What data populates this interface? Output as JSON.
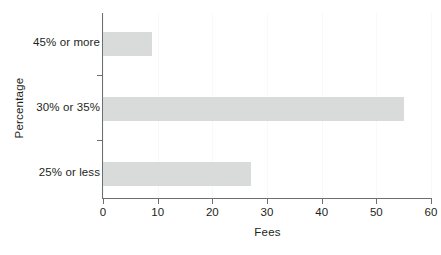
{
  "chart_data": {
    "type": "bar",
    "orientation": "horizontal",
    "title": "",
    "xlabel": "Fees",
    "ylabel": "Percentage",
    "categories": [
      "25% or less",
      "30% or 35%",
      "45% or more"
    ],
    "values": [
      27,
      55,
      9
    ],
    "xlim": [
      0,
      60
    ],
    "xticks": [
      0,
      10,
      20,
      30,
      40,
      50,
      60
    ],
    "xtick_labels": [
      "0",
      "10",
      "20",
      "30",
      "40",
      "50",
      "60"
    ],
    "grid": true,
    "grid_axis": "x",
    "legend": null,
    "bar_color": "#d9dada",
    "axis_color": "#6d6e71",
    "text_color": "#231f20",
    "background": "#ffffff"
  }
}
